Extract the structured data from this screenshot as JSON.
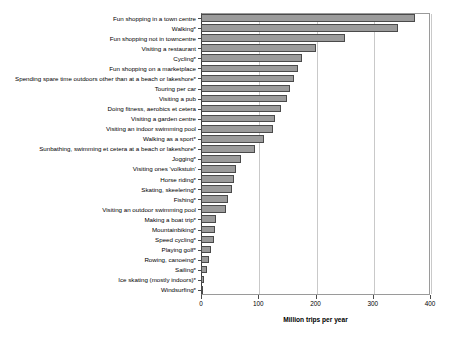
{
  "chart_data": {
    "type": "bar",
    "orientation": "horizontal",
    "title": "",
    "xlabel": "Million trips per year",
    "ylabel": "",
    "xlim": [
      0,
      400
    ],
    "xticks": [
      0,
      100,
      200,
      300,
      400
    ],
    "xtick_labels": [
      "0",
      "100",
      "200",
      "300",
      "400"
    ],
    "grid": "vertical",
    "legend": "none",
    "bar_color": "#9b9b9b",
    "bar_edge_color": "#4a4a4a",
    "categories": [
      "Fun shopping in a town centre",
      "Walking*",
      "Fun shopping not in towncentre",
      "Visiting a restaurant",
      "Cycling*",
      "Fun shopping on a marketplace",
      "Spending spare time outdoors other than at a beach or lakeshore*",
      "Touring per car",
      "Visiting a pub",
      "Doing fitness, aerobics et cetera",
      "Visiting a garden centre",
      "Visiting an indoor swimming pool",
      "Walking as a sport*",
      "Sunbathing, swimming et cetera at a beach or lakeshore*",
      "Jogging*",
      "Visiting ones 'volkstuin'",
      "Horse riding*",
      "Skating, skeelering*",
      "Fishing*",
      "Visiting an outdoor swimming pool",
      "Making a boat trip*",
      "Mountainbiking*",
      "Speed cycling*",
      "Playing golf*",
      "Rowing, canoeing*",
      "Sailing*",
      "Ice skating (mostly indoors)*",
      "Windsurfing*"
    ],
    "values": [
      374,
      344,
      252,
      200,
      176,
      170,
      163,
      155,
      150,
      140,
      130,
      125,
      110,
      95,
      70,
      62,
      57,
      54,
      47,
      43,
      27,
      24,
      22,
      18,
      14,
      10,
      6,
      2
    ]
  }
}
